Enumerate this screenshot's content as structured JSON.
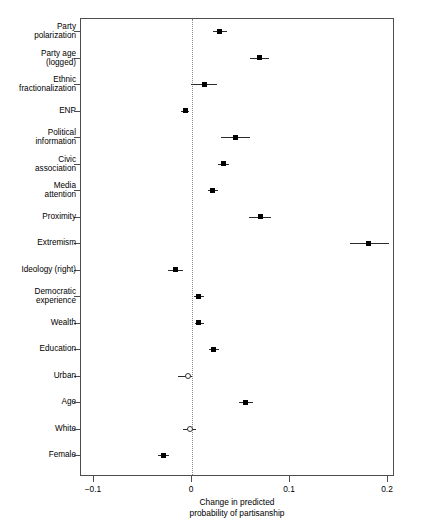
{
  "chart_data": {
    "type": "scatter",
    "title": "",
    "subtitle": "",
    "xlabel": "Change in predicted\nprobability of partisanship",
    "ylabel": "",
    "xlim": [
      -0.13,
      0.207
    ],
    "ylim": [
      0,
      17
    ],
    "grid": false,
    "legend": null,
    "orientation": "horizontal",
    "plot_style": "coefficient dot-and-whisker plot with vertical dotted reference line at x = 0",
    "reference_line": 0,
    "xticks": [
      -0.1,
      0,
      0.1,
      0.2
    ],
    "xticklabels": [
      "−0.1",
      "0",
      "0.1",
      "0.2"
    ],
    "categories": [
      "Party polarization",
      "Party age (logged)",
      "Ethnic fractionalization",
      "ENP",
      "Political information",
      "Civic association",
      "Media attention",
      "Proximity",
      "Extremism",
      "Ideology (right)",
      "Democratic experience",
      "Wealth",
      "Education",
      "Urban",
      "Age",
      "White",
      "Female"
    ],
    "points": [
      {
        "label": "Party polarization",
        "estimate": 0.029,
        "ci_low": 0.022,
        "ci_high": 0.037,
        "marker": "filled",
        "significant": true
      },
      {
        "label": "Party age (logged)",
        "estimate": 0.07,
        "ci_low": 0.06,
        "ci_high": 0.08,
        "marker": "filled",
        "significant": true
      },
      {
        "label": "Ethnic fractionalization",
        "estimate": 0.014,
        "ci_low": 0.0,
        "ci_high": 0.027,
        "marker": "filled",
        "significant": true
      },
      {
        "label": "ENP",
        "estimate": -0.006,
        "ci_low": -0.01,
        "ci_high": -0.002,
        "marker": "filled",
        "significant": true
      },
      {
        "label": "Political information",
        "estimate": 0.045,
        "ci_low": 0.031,
        "ci_high": 0.06,
        "marker": "filled",
        "significant": true
      },
      {
        "label": "Civic association",
        "estimate": 0.033,
        "ci_low": 0.028,
        "ci_high": 0.039,
        "marker": "filled",
        "significant": true
      },
      {
        "label": "Media attention",
        "estimate": 0.022,
        "ci_low": 0.017,
        "ci_high": 0.028,
        "marker": "filled",
        "significant": true
      },
      {
        "label": "Proximity",
        "estimate": 0.071,
        "ci_low": 0.059,
        "ci_high": 0.082,
        "marker": "filled",
        "significant": true
      },
      {
        "label": "Extremism",
        "estimate": 0.181,
        "ci_low": 0.162,
        "ci_high": 0.202,
        "marker": "filled",
        "significant": true
      },
      {
        "label": "Ideology (right)",
        "estimate": -0.016,
        "ci_low": -0.023,
        "ci_high": -0.008,
        "marker": "filled",
        "significant": true
      },
      {
        "label": "Democratic experience",
        "estimate": 0.008,
        "ci_low": 0.003,
        "ci_high": 0.013,
        "marker": "filled",
        "significant": true
      },
      {
        "label": "Wealth",
        "estimate": 0.008,
        "ci_low": 0.004,
        "ci_high": 0.013,
        "marker": "filled",
        "significant": true
      },
      {
        "label": "Education",
        "estimate": 0.023,
        "ci_low": 0.018,
        "ci_high": 0.029,
        "marker": "filled",
        "significant": true
      },
      {
        "label": "Urban",
        "estimate": -0.003,
        "ci_low": -0.013,
        "ci_high": 0.001,
        "marker": "hollow",
        "significant": false
      },
      {
        "label": "Age",
        "estimate": 0.056,
        "ci_low": 0.049,
        "ci_high": 0.063,
        "marker": "filled",
        "significant": true
      },
      {
        "label": "White",
        "estimate": -0.001,
        "ci_low": -0.008,
        "ci_high": 0.005,
        "marker": "hollow",
        "significant": false
      },
      {
        "label": "Female",
        "estimate": -0.028,
        "ci_low": -0.034,
        "ci_high": -0.022,
        "marker": "filled",
        "significant": true
      }
    ]
  }
}
